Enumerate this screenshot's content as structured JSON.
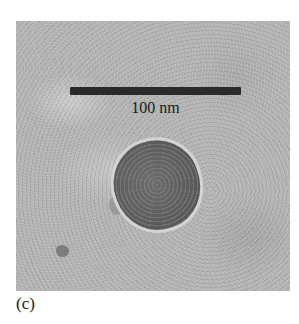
{
  "figure": {
    "panel_label": "(c)",
    "scale_bar": {
      "label": "100 nm",
      "color": "#2a2a2a"
    },
    "image_description": "Grayscale TEM micrograph of a single roughly circular nanoparticle with a textured, lattice-like interior and bright rim on a mottled gray background",
    "background_color": "#b7b7b7",
    "particle_color": "#5e5e5e"
  }
}
